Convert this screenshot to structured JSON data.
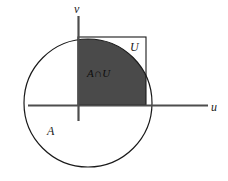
{
  "figure": {
    "title": "",
    "background_color": "#ffffff",
    "stroke_color": "#1a1a1a",
    "shade_color": "#4a4a4a"
  },
  "axes": {
    "horizontal": {
      "label": "u",
      "y": 105,
      "x_start": 28,
      "x_end": 208
    },
    "vertical": {
      "label": "v",
      "x": 78,
      "y_start": 16,
      "y_end": 121
    },
    "origin": {
      "x": 78,
      "y": 105
    }
  },
  "shapes": {
    "circle": {
      "name": "A",
      "label": "A",
      "center_x": 88,
      "center_y": 103,
      "radius": 64,
      "filled": false
    },
    "square": {
      "name": "U",
      "label": "U",
      "left": 78,
      "top": 37,
      "right": 146,
      "bottom": 105
    },
    "intersection": {
      "label": "A∩U",
      "description": "shaded overlap of circle A and square U in the first quadrant"
    }
  },
  "labels": {
    "v_axis": "v",
    "u_axis": "u",
    "set_u": "U",
    "set_a": "A",
    "intersection": "A∩U"
  }
}
